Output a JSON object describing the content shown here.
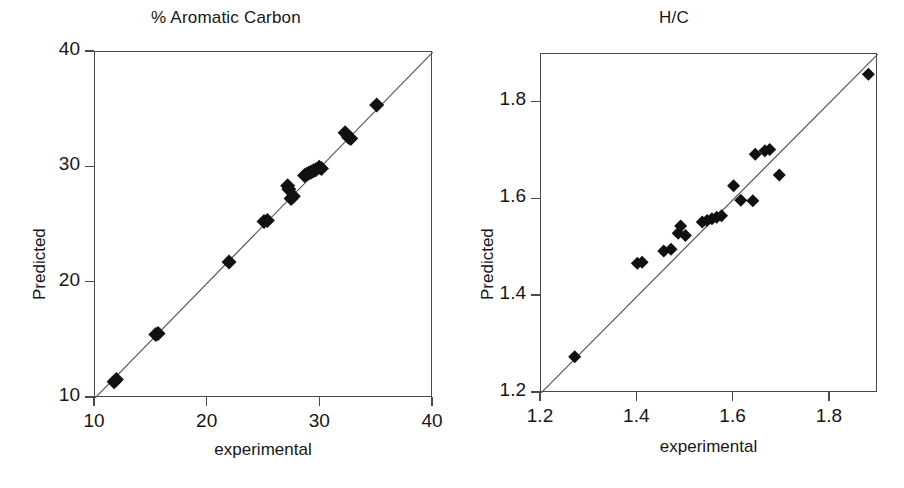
{
  "figure": {
    "background": "#ffffff",
    "marker_color": "#111111",
    "axis_color": "#4a4a4a",
    "line_color": "#555555"
  },
  "panels": [
    {
      "id": "aromatic-carbon",
      "title": "% Aromatic Carbon",
      "xlabel": "experimental",
      "ylabel": "Predicted",
      "xticklabels": [
        "10",
        "20",
        "30",
        "40"
      ],
      "yticklabels": [
        "10",
        "20",
        "30",
        "40"
      ]
    },
    {
      "id": "h-over-c",
      "title": "H/C",
      "xlabel": "experimental",
      "ylabel": "Predicted",
      "xticklabels": [
        "1.2",
        "1.4",
        "1.6",
        "1.8"
      ],
      "yticklabels": [
        "1.2",
        "1.4",
        "1.6",
        "1.8"
      ]
    }
  ],
  "chart_data": [
    {
      "type": "scatter",
      "title": "% Aromatic Carbon",
      "xlabel": "experimental",
      "ylabel": "Predicted",
      "xlim": [
        10,
        40
      ],
      "ylim": [
        10,
        40
      ],
      "xticks": [
        10,
        20,
        30,
        40
      ],
      "yticks": [
        10,
        20,
        30,
        40
      ],
      "grid": false,
      "legend": null,
      "reference_line": {
        "type": "identity",
        "from": [
          10,
          10
        ],
        "to": [
          40,
          40
        ]
      },
      "points": [
        {
          "x": 11.7,
          "y": 11.4
        },
        {
          "x": 11.9,
          "y": 11.6
        },
        {
          "x": 15.4,
          "y": 15.5
        },
        {
          "x": 15.6,
          "y": 15.6
        },
        {
          "x": 21.9,
          "y": 21.8
        },
        {
          "x": 25.0,
          "y": 25.3
        },
        {
          "x": 25.3,
          "y": 25.4
        },
        {
          "x": 27.1,
          "y": 28.4
        },
        {
          "x": 27.2,
          "y": 28.1
        },
        {
          "x": 27.4,
          "y": 27.3
        },
        {
          "x": 27.6,
          "y": 27.5
        },
        {
          "x": 28.6,
          "y": 29.3
        },
        {
          "x": 28.8,
          "y": 29.4
        },
        {
          "x": 29.0,
          "y": 29.5
        },
        {
          "x": 29.2,
          "y": 29.6
        },
        {
          "x": 29.4,
          "y": 29.7
        },
        {
          "x": 29.6,
          "y": 29.8
        },
        {
          "x": 29.9,
          "y": 30.0
        },
        {
          "x": 30.1,
          "y": 29.9
        },
        {
          "x": 32.2,
          "y": 33.0
        },
        {
          "x": 32.5,
          "y": 32.6
        },
        {
          "x": 32.7,
          "y": 32.5
        },
        {
          "x": 35.0,
          "y": 35.4
        }
      ]
    },
    {
      "type": "scatter",
      "title": "H/C",
      "xlabel": "experimental",
      "ylabel": "Predicted",
      "xlim": [
        1.2,
        1.9
      ],
      "ylim": [
        1.2,
        1.9
      ],
      "xticks": [
        1.2,
        1.4,
        1.6,
        1.8
      ],
      "yticks": [
        1.2,
        1.4,
        1.6,
        1.8
      ],
      "grid": false,
      "legend": null,
      "reference_line": {
        "type": "identity",
        "from": [
          1.2,
          1.2
        ],
        "to": [
          1.9,
          1.9
        ]
      },
      "points": [
        {
          "x": 1.27,
          "y": 1.275
        },
        {
          "x": 1.4,
          "y": 1.468
        },
        {
          "x": 1.41,
          "y": 1.47
        },
        {
          "x": 1.455,
          "y": 1.493
        },
        {
          "x": 1.47,
          "y": 1.497
        },
        {
          "x": 1.485,
          "y": 1.53
        },
        {
          "x": 1.49,
          "y": 1.545
        },
        {
          "x": 1.5,
          "y": 1.525
        },
        {
          "x": 1.535,
          "y": 1.553
        },
        {
          "x": 1.545,
          "y": 1.556
        },
        {
          "x": 1.555,
          "y": 1.56
        },
        {
          "x": 1.565,
          "y": 1.563
        },
        {
          "x": 1.575,
          "y": 1.566
        },
        {
          "x": 1.6,
          "y": 1.628
        },
        {
          "x": 1.615,
          "y": 1.598
        },
        {
          "x": 1.645,
          "y": 1.693
        },
        {
          "x": 1.665,
          "y": 1.7
        },
        {
          "x": 1.675,
          "y": 1.703
        },
        {
          "x": 1.64,
          "y": 1.597
        },
        {
          "x": 1.695,
          "y": 1.65
        },
        {
          "x": 1.88,
          "y": 1.858
        }
      ]
    }
  ]
}
